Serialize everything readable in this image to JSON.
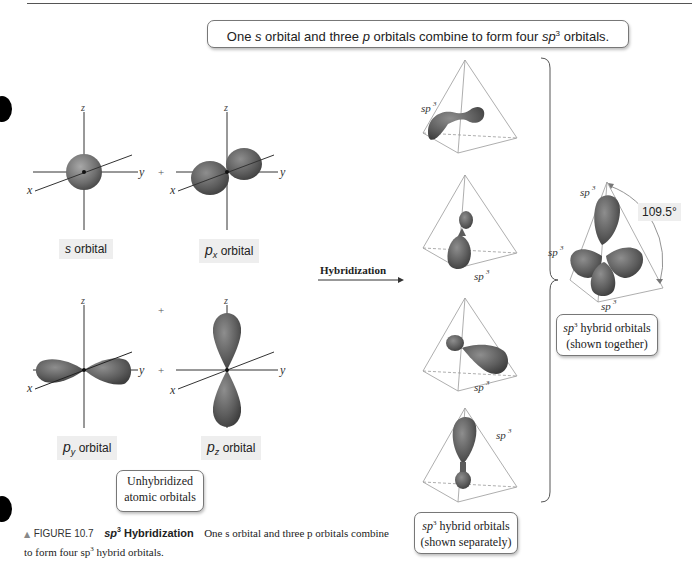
{
  "header": {
    "summary_parts": [
      "One ",
      "s",
      " orbital and three ",
      "p",
      " orbitals combine to form four ",
      "sp",
      "3",
      " orbitals."
    ]
  },
  "unhybridized": {
    "orbitals": [
      {
        "id": "s",
        "label_main": "s",
        "label_sub": "",
        "label_rest": " orbital"
      },
      {
        "id": "px",
        "label_main": "p",
        "label_sub": "x",
        "label_rest": " orbital"
      },
      {
        "id": "py",
        "label_main": "p",
        "label_sub": "y",
        "label_rest": " orbital"
      },
      {
        "id": "pz",
        "label_main": "p",
        "label_sub": "z",
        "label_rest": " orbital"
      }
    ],
    "axes": {
      "x": "x",
      "y": "y",
      "z": "z"
    },
    "plus": "+",
    "caption_line1": "Unhybridized",
    "caption_line2": "atomic orbitals"
  },
  "arrow": {
    "label": "Hybridization"
  },
  "hybrid_separate": {
    "label": "sp",
    "label_sup": "3",
    "caption_line1_main": "sp",
    "caption_line1_sup": "3",
    "caption_line1_rest": " hybrid orbitals",
    "caption_line2": "(shown separately)"
  },
  "hybrid_together": {
    "label": "sp",
    "label_sup": "3",
    "angle": "109.5°",
    "caption_line1_main": "sp",
    "caption_line1_sup": "3",
    "caption_line1_rest": " hybrid orbitals",
    "caption_line2": "(shown together)"
  },
  "figure_caption": {
    "marker": "▲",
    "number": "FIGURE 10.7",
    "title_main": "sp",
    "title_sup": "3",
    "title_rest": " Hybridization",
    "text_line1": "One s orbital and three p orbitals combine",
    "text_line2": "to form four sp",
    "text_sup": "3",
    "text_line2_rest": " hybrid orbitals."
  },
  "colors": {
    "orbital": "#6e6e6e",
    "orbital_dark": "#4a4a4a",
    "orbital_light": "#9a9a9a",
    "line": "#333333",
    "tetra": "#999999",
    "label_bg": "#eeeeee"
  }
}
